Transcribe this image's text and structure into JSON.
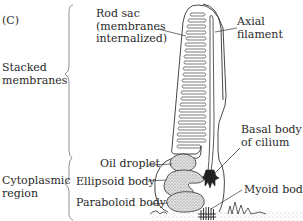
{
  "panel_label": "(C)",
  "regions": [
    {
      "label_lines": [
        "Stacked",
        "membranes"
      ]
    },
    {
      "label_lines": [
        "Cytoplasmic",
        "region"
      ]
    }
  ],
  "structures": {
    "rod_sac": {
      "label_lines": [
        "Rod sac",
        "(membranes",
        "internalized)"
      ]
    },
    "axial_filament": {
      "label_lines": [
        "Axial",
        "filament"
      ]
    },
    "basal_body": {
      "label_lines": [
        "Basal body",
        "of cilium"
      ]
    },
    "oil_droplet": {
      "label": "Oil droplet"
    },
    "ellipsoid_body": {
      "label": "Ellipsoid body"
    },
    "paraboloid_body": {
      "label": "Paraboloid body"
    },
    "myoid_body": {
      "label": "Myoid body"
    }
  },
  "colors": {
    "line": "#333333",
    "stipple": "#9a9a9a",
    "brace": "#777777"
  }
}
